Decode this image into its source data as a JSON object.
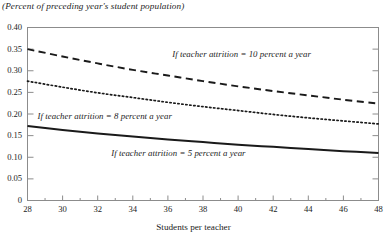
{
  "chart_data": {
    "type": "line",
    "title": "(Percent of preceding year's student population)",
    "xlabel": "Students per teacher",
    "ylabel": "",
    "xlim": [
      28,
      48
    ],
    "ylim": [
      0,
      0.4
    ],
    "grid": false,
    "legend_position": "inline-annotations",
    "xticks": [
      "28",
      "30",
      "32",
      "34",
      "36",
      "38",
      "40",
      "42",
      "44",
      "46",
      "48"
    ],
    "xtick_values": [
      28,
      30,
      32,
      34,
      36,
      38,
      40,
      42,
      44,
      46,
      48
    ],
    "xminor_ticks": [
      29,
      31,
      33,
      35,
      37,
      39,
      41,
      43,
      45,
      47
    ],
    "yticks": [
      "0",
      "0.05",
      "0.10",
      "0.15",
      "0.20",
      "0.25",
      "0.30",
      "0.35",
      "0.40"
    ],
    "ytick_values": [
      0,
      0.05,
      0.1,
      0.15,
      0.2,
      0.25,
      0.3,
      0.35,
      0.4
    ],
    "x": [
      28,
      30,
      32,
      34,
      36,
      38,
      40,
      42,
      44,
      46,
      48
    ],
    "series": [
      {
        "name": "If teacher attrition = 10 percent a year",
        "style": "dashed",
        "color": "#1a1a1a",
        "values": [
          0.35,
          0.333,
          0.317,
          0.302,
          0.289,
          0.276,
          0.264,
          0.253,
          0.243,
          0.233,
          0.224
        ],
        "label_x": 40.2,
        "label_y": 0.337
      },
      {
        "name": "If teacher attrition = 8 percent a year",
        "style": "dotted",
        "color": "#1a1a1a",
        "values": [
          0.276,
          0.262,
          0.249,
          0.238,
          0.227,
          0.217,
          0.208,
          0.199,
          0.191,
          0.184,
          0.177
        ],
        "label_x": 32.4,
        "label_y": 0.192
      },
      {
        "name": "If teacher attrition = 5 percent a year",
        "style": "solid",
        "color": "#1a1a1a",
        "values": [
          0.172,
          0.163,
          0.155,
          0.148,
          0.141,
          0.135,
          0.129,
          0.124,
          0.119,
          0.114,
          0.11
        ],
        "label_x": 36.6,
        "label_y": 0.108
      }
    ]
  },
  "axis": {
    "frame_color": "#8c8c8c"
  }
}
